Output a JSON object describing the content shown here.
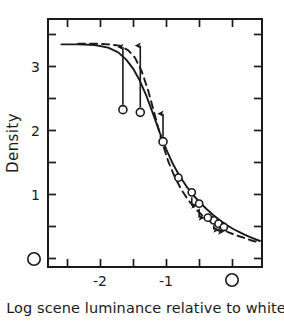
{
  "chart_data": {
    "type": "line",
    "title": "",
    "xlabel": "Log scene luminance relative to white",
    "ylabel": "Density",
    "xlim": [
      -2.75,
      0.45
    ],
    "ylim": [
      -0.12,
      3.6
    ],
    "grid": false,
    "legend": "none",
    "x_tick_labels": [
      "-2",
      "-1",
      "O"
    ],
    "x_tick_values": [
      -2,
      -1,
      0
    ],
    "x_minor_tick_values": [
      -2.5,
      -1.5,
      -0.5,
      0.4
    ],
    "y_tick_labels": [
      "3",
      "2",
      "1",
      "O"
    ],
    "y_tick_values": [
      3,
      2,
      1,
      0
    ],
    "y_minor_tick_values": [
      3.5,
      2.5,
      1.5,
      0.5
    ],
    "series": [
      {
        "name": "solid-curve",
        "style": "solid",
        "x": [
          -2.55,
          -2.3,
          -2.05,
          -1.85,
          -1.7,
          -1.58,
          -1.48,
          -1.38,
          -1.28,
          -1.18,
          -1.08,
          -0.98,
          -0.88,
          -0.78,
          -0.68,
          -0.58,
          -0.48,
          -0.38,
          -0.28,
          -0.18,
          -0.08,
          0.02,
          0.12,
          0.22,
          0.32,
          0.42
        ],
        "y": [
          3.22,
          3.22,
          3.21,
          3.17,
          3.1,
          2.99,
          2.86,
          2.68,
          2.45,
          2.18,
          1.9,
          1.64,
          1.42,
          1.24,
          1.09,
          0.96,
          0.85,
          0.75,
          0.66,
          0.58,
          0.51,
          0.45,
          0.4,
          0.35,
          0.31,
          0.27
        ]
      },
      {
        "name": "dashed-curve",
        "style": "dashed",
        "x": [
          -2.3,
          -2.05,
          -1.85,
          -1.68,
          -1.55,
          -1.45,
          -1.35,
          -1.25,
          -1.15,
          -1.05,
          -0.95,
          -0.85,
          -0.75,
          -0.65,
          -0.55,
          -0.45,
          -0.35,
          -0.25,
          -0.15,
          -0.05,
          0.08,
          0.2,
          0.32,
          0.42
        ],
        "y": [
          3.23,
          3.23,
          3.22,
          3.2,
          3.13,
          3.02,
          2.82,
          2.52,
          2.15,
          1.77,
          1.46,
          1.22,
          1.03,
          0.88,
          0.76,
          0.66,
          0.58,
          0.51,
          0.45,
          0.4,
          0.35,
          0.31,
          0.27,
          0.25
        ]
      }
    ],
    "points_with_up_arrows": [
      {
        "x": -1.63,
        "y": 2.24,
        "arrow_to_y": 3.18
      },
      {
        "x": -1.37,
        "y": 2.2,
        "arrow_to_y": 3.2
      },
      {
        "x": -1.03,
        "y": 1.76,
        "arrow_to_y": 2.18
      }
    ],
    "points_with_down_arrows": [
      {
        "x": -0.6,
        "y": 1.0,
        "arrow_to_y": 0.8
      },
      {
        "x": -0.49,
        "y": 0.83,
        "arrow_to_y": 0.62
      },
      {
        "x": -0.27,
        "y": 0.58,
        "arrow_to_y": 0.44
      },
      {
        "x": -0.2,
        "y": 0.53,
        "arrow_to_y": 0.41
      }
    ],
    "plain_points": [
      {
        "x": -0.8,
        "y": 1.22
      },
      {
        "x": -0.36,
        "y": 0.62
      },
      {
        "x": -0.12,
        "y": 0.48
      }
    ]
  },
  "axes": {
    "y_axis_title": "Density",
    "x_axis_caption": "Log scene luminance relative to white",
    "y_labels": [
      "3",
      "2",
      "1",
      "O"
    ],
    "x_labels": [
      "-2",
      "-1",
      "O"
    ]
  }
}
